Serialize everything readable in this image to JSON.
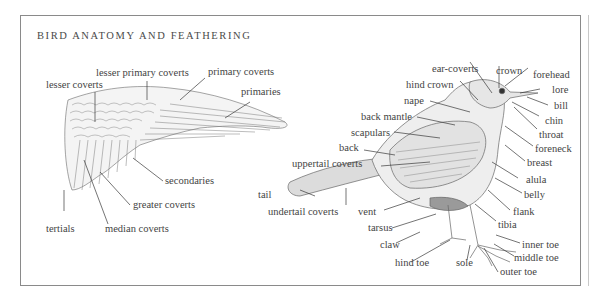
{
  "title": "BIRD ANATOMY AND FEATHERING",
  "wing_labels": {
    "lesser_coverts": "lesser coverts",
    "lesser_primary_coverts": "lesser primary coverts",
    "primary_coverts": "primary coverts",
    "primaries": "primaries",
    "secondaries": "secondaries",
    "greater_coverts": "greater coverts",
    "tertials": "tertials",
    "median_coverts": "median coverts"
  },
  "body_labels": {
    "ear_coverts": "ear-coverts",
    "crown": "crown",
    "forehead": "forehead",
    "hind_crown": "hind crown",
    "lore": "lore",
    "bill": "bill",
    "nape": "nape",
    "chin": "chin",
    "back_mantle": "back mantle",
    "throat": "throat",
    "scapulars": "scapulars",
    "foreneck": "foreneck",
    "back": "back",
    "breast": "breast",
    "uppertail_coverts": "uppertail coverts",
    "alula": "alula",
    "tail": "tail",
    "belly": "belly",
    "undertail_coverts": "undertail coverts",
    "vent": "vent",
    "flank": "flank",
    "tarsus": "tarsus",
    "tibia": "tibia",
    "claw": "claw",
    "inner_toe": "inner toe",
    "middle_toe": "middle toe",
    "hind_toe": "hind toe",
    "sole": "sole",
    "outer_toe": "outer toe"
  }
}
